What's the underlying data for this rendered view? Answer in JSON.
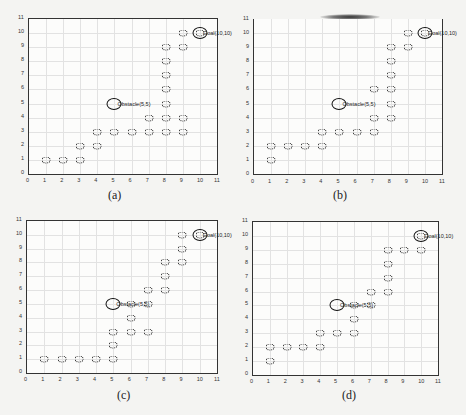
{
  "chart_data": [
    {
      "type": "scatter",
      "caption": "(a)",
      "xlim": [
        0,
        11
      ],
      "ylim": [
        0,
        11
      ],
      "xticks": [
        0,
        1,
        2,
        3,
        4,
        5,
        6,
        7,
        8,
        9,
        10,
        11
      ],
      "yticks": [
        0,
        1,
        2,
        3,
        4,
        5,
        6,
        7,
        8,
        9,
        10,
        11
      ],
      "grid": true,
      "obstacle": {
        "x": 5,
        "y": 5,
        "label": "Obstacle(5,5)"
      },
      "goal": {
        "x": 10,
        "y": 10,
        "label": "Goal(10,10)"
      },
      "points": [
        [
          1,
          1
        ],
        [
          2,
          1
        ],
        [
          3,
          1
        ],
        [
          3,
          2
        ],
        [
          4,
          2
        ],
        [
          4,
          3
        ],
        [
          5,
          3
        ],
        [
          6,
          3
        ],
        [
          7,
          3
        ],
        [
          7,
          4
        ],
        [
          8,
          3
        ],
        [
          8,
          4
        ],
        [
          8,
          5
        ],
        [
          8,
          6
        ],
        [
          8,
          7
        ],
        [
          8,
          8
        ],
        [
          8,
          9
        ],
        [
          9,
          3
        ],
        [
          9,
          4
        ],
        [
          9,
          9
        ],
        [
          9,
          10
        ],
        [
          10,
          10
        ]
      ]
    },
    {
      "type": "scatter",
      "caption": "(b)",
      "xlim": [
        0,
        11
      ],
      "ylim": [
        0,
        11
      ],
      "xticks": [
        0,
        1,
        2,
        3,
        4,
        5,
        6,
        7,
        8,
        9,
        10,
        11
      ],
      "yticks": [
        0,
        1,
        2,
        3,
        4,
        5,
        6,
        7,
        8,
        9,
        10,
        11
      ],
      "grid": true,
      "obstacle": {
        "x": 5,
        "y": 5,
        "label": "Obstacle(5,5)"
      },
      "goal": {
        "x": 10,
        "y": 10,
        "label": "Goal(10,10)"
      },
      "points": [
        [
          1,
          1
        ],
        [
          1,
          2
        ],
        [
          2,
          2
        ],
        [
          3,
          2
        ],
        [
          4,
          2
        ],
        [
          4,
          3
        ],
        [
          5,
          3
        ],
        [
          6,
          3
        ],
        [
          7,
          3
        ],
        [
          7,
          4
        ],
        [
          7,
          6
        ],
        [
          8,
          4
        ],
        [
          8,
          5
        ],
        [
          8,
          6
        ],
        [
          8,
          7
        ],
        [
          8,
          8
        ],
        [
          8,
          9
        ],
        [
          9,
          9
        ],
        [
          9,
          10
        ],
        [
          10,
          10
        ]
      ]
    },
    {
      "type": "scatter",
      "caption": "(c)",
      "xlim": [
        0,
        11
      ],
      "ylim": [
        0,
        11
      ],
      "xticks": [
        0,
        1,
        2,
        3,
        4,
        5,
        6,
        7,
        8,
        9,
        10,
        11
      ],
      "yticks": [
        0,
        1,
        2,
        3,
        4,
        5,
        6,
        7,
        8,
        9,
        10,
        11
      ],
      "grid": true,
      "obstacle": {
        "x": 5,
        "y": 5,
        "label": "Obstacle(5,5)"
      },
      "goal": {
        "x": 10,
        "y": 10,
        "label": "Goal(10,10)"
      },
      "points": [
        [
          1,
          1
        ],
        [
          2,
          1
        ],
        [
          3,
          1
        ],
        [
          4,
          1
        ],
        [
          5,
          1
        ],
        [
          5,
          2
        ],
        [
          5,
          3
        ],
        [
          6,
          3
        ],
        [
          6,
          4
        ],
        [
          6,
          5
        ],
        [
          7,
          3
        ],
        [
          7,
          5
        ],
        [
          7,
          6
        ],
        [
          8,
          6
        ],
        [
          8,
          7
        ],
        [
          8,
          8
        ],
        [
          9,
          8
        ],
        [
          9,
          9
        ],
        [
          9,
          10
        ],
        [
          10,
          10
        ]
      ]
    },
    {
      "type": "scatter",
      "caption": "(d)",
      "xlim": [
        0,
        11
      ],
      "ylim": [
        0,
        11
      ],
      "xticks": [
        0,
        1,
        2,
        3,
        4,
        5,
        6,
        7,
        8,
        9,
        10,
        11
      ],
      "yticks": [
        0,
        1,
        2,
        3,
        4,
        5,
        6,
        7,
        8,
        9,
        10,
        11
      ],
      "grid": true,
      "obstacle": {
        "x": 5,
        "y": 5,
        "label": "Obstacle(5,5)"
      },
      "goal": {
        "x": 10,
        "y": 10,
        "label": "Goal(10,10)"
      },
      "points": [
        [
          1,
          1
        ],
        [
          1,
          2
        ],
        [
          2,
          2
        ],
        [
          3,
          2
        ],
        [
          4,
          2
        ],
        [
          4,
          3
        ],
        [
          5,
          3
        ],
        [
          6,
          3
        ],
        [
          6,
          4
        ],
        [
          6,
          5
        ],
        [
          7,
          5
        ],
        [
          7,
          6
        ],
        [
          8,
          6
        ],
        [
          8,
          7
        ],
        [
          8,
          8
        ],
        [
          8,
          9
        ],
        [
          9,
          9
        ],
        [
          10,
          9
        ],
        [
          10,
          10
        ]
      ]
    }
  ],
  "layout": [
    {
      "left": 28,
      "top": 18,
      "width": 188,
      "height": 155,
      "capX": 108,
      "capY": 188,
      "style": "boxed"
    },
    {
      "left": 253,
      "top": 19,
      "width": 188,
      "height": 155,
      "capX": 333,
      "capY": 188,
      "style": "rightonly"
    },
    {
      "left": 26,
      "top": 220,
      "width": 190,
      "height": 152,
      "capX": 117,
      "capY": 388,
      "style": "boxed"
    },
    {
      "left": 252,
      "top": 221,
      "width": 185,
      "height": 153,
      "capX": 342,
      "capY": 388,
      "style": "boxed"
    }
  ]
}
